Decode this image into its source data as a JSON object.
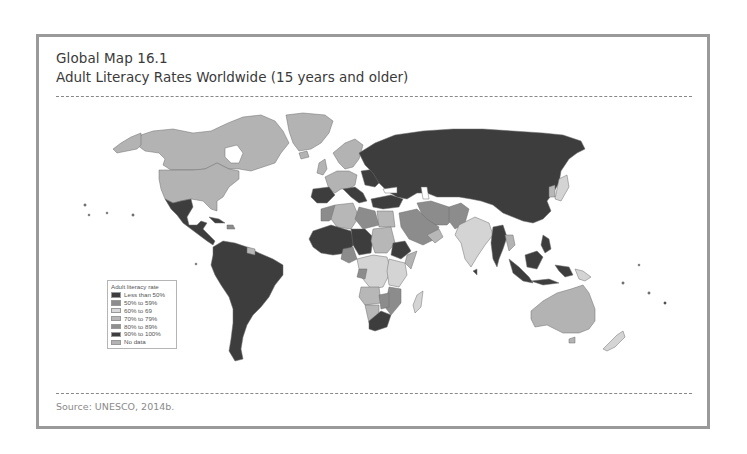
{
  "figure": {
    "label": "Global Map 16.1",
    "title": "Adult Literacy Rates Worldwide (15 years and older)",
    "source": "Source: UNESCO, 2014b."
  },
  "legend": {
    "title": "Adult literacy rate",
    "items": [
      {
        "label": "Less than 50%",
        "color": "#3d3d3d"
      },
      {
        "label": "50% to 59%",
        "color": "#8c8c8c"
      },
      {
        "label": "60% to 69",
        "color": "#d9d9d9"
      },
      {
        "label": "70% to 79%",
        "color": "#b7b7b7"
      },
      {
        "label": "80% to 89%",
        "color": "#8f8f8f"
      },
      {
        "label": "90% to 100%",
        "color": "#3d3d3d"
      },
      {
        "label": "No data",
        "color": "#b3b3b3"
      }
    ]
  },
  "colors": {
    "frame_border": "#9a9a9a",
    "ocean": "#ffffff",
    "dark": "#3d3d3d",
    "mid": "#8c8c8c",
    "light": "#d4d4d4",
    "nodata": "#b3b3b3"
  }
}
